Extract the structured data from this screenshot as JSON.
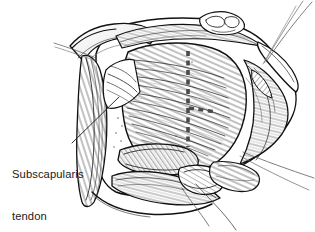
{
  "figure": {
    "kind": "medical-line-illustration",
    "background_color": "#ffffff",
    "ink_color": "#1a1a1a",
    "width": 315,
    "height": 232
  },
  "labels": [
    {
      "name": "subscapularis-tendon",
      "line1": "Subscapularis",
      "line2": "tendon",
      "text_color": "#1a1a1a",
      "x": 12,
      "y": 139,
      "leader": {
        "from_x": 72,
        "from_y": 143,
        "to_x": 119,
        "to_y": 97
      }
    }
  ],
  "annotations": {
    "incision_line": {
      "name": "dashed-incision-line",
      "style": "dashed",
      "color": "#4a4a4a",
      "description": "Vertical dashed tenotomy line with short horizontal branch",
      "vertical_from_y": 51,
      "vertical_to_y": 147,
      "vertical_x": 188,
      "branch_y": 108,
      "branch_to_x": 216
    },
    "sutures": [
      {
        "name": "suture-thread-top-1",
        "x1": 312,
        "y1": 2,
        "x2": 266,
        "y2": 62
      },
      {
        "name": "suture-thread-top-2",
        "x1": 303,
        "y1": 1,
        "x2": 264,
        "y2": 63
      },
      {
        "name": "suture-thread-top-3",
        "x1": 296,
        "y1": 6,
        "x2": 263,
        "y2": 64
      },
      {
        "name": "suture-thread-right-1",
        "x1": 314,
        "y1": 178,
        "x2": 243,
        "y2": 152
      },
      {
        "name": "suture-thread-right-2",
        "x1": 309,
        "y1": 190,
        "x2": 240,
        "y2": 156
      },
      {
        "name": "suture-thread-bottom-1",
        "x1": 236,
        "y1": 230,
        "x2": 196,
        "y2": 184
      },
      {
        "name": "suture-thread-bottom-2",
        "x1": 209,
        "y1": 226,
        "x2": 182,
        "y2": 188
      },
      {
        "name": "suture-thread-left-1",
        "x1": 54,
        "y1": 43,
        "x2": 96,
        "y2": 58
      },
      {
        "name": "suture-thread-left-2",
        "x1": 55,
        "y1": 47,
        "x2": 97,
        "y2": 61
      }
    ]
  }
}
